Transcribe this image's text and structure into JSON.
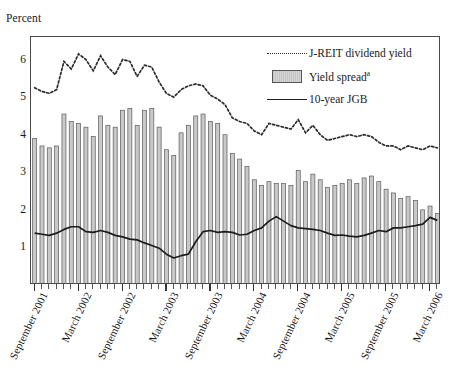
{
  "page": {
    "top_rule_text": "",
    "axis_title_y": "Percent"
  },
  "legend": {
    "items": [
      {
        "label": "J-REIT dividend yield",
        "key": "dotted-line-key",
        "color": "#2b2b2b"
      },
      {
        "label": "Yield spread",
        "sup": "a",
        "key": "gray-box-key",
        "color": "#c9c9c9"
      },
      {
        "label": "10-year JGB",
        "key": "solid-line-key",
        "color": "#1c1c1c"
      }
    ]
  },
  "chart_data": {
    "type": "bar",
    "title": "",
    "subtitle": "",
    "xlabel": "",
    "ylabel": "Percent",
    "ylim": [
      0,
      6.6
    ],
    "yticks": [
      1,
      2,
      3,
      4,
      5,
      6
    ],
    "grid": false,
    "legend_position": "top-right",
    "x": [
      "September 2001",
      "October 2001",
      "November 2001",
      "December 2001",
      "January 2002",
      "February 2002",
      "March 2002",
      "April 2002",
      "May 2002",
      "June 2002",
      "July 2002",
      "August 2002",
      "September 2002",
      "October 2002",
      "November 2002",
      "December 2002",
      "January 2003",
      "February 2003",
      "March 2003",
      "April 2003",
      "May 2003",
      "June 2003",
      "July 2003",
      "August 2003",
      "September 2003",
      "October 2003",
      "November 2003",
      "December 2003",
      "January 2004",
      "February 2004",
      "March 2004",
      "April 2004",
      "May 2004",
      "June 2004",
      "July 2004",
      "August 2004",
      "September 2004",
      "October 2004",
      "November 2004",
      "December 2004",
      "January 2005",
      "February 2005",
      "March 2005",
      "April 2005",
      "May 2005",
      "June 2005",
      "July 2005",
      "August 2005",
      "September 2005",
      "October 2005",
      "November 2005",
      "December 2005",
      "January 2006",
      "February 2006",
      "March 2006",
      "April 2006"
    ],
    "xtick_labels": [
      "September 2001",
      "March 2002",
      "September 2002",
      "March 2003",
      "September 2003",
      "March 2004",
      "September 2004",
      "March 2005",
      "September 2005",
      "March 2006"
    ],
    "xtick_indices": [
      0,
      6,
      12,
      18,
      24,
      30,
      36,
      42,
      48,
      54
    ],
    "series": [
      {
        "name": "Yield spread",
        "type": "bar",
        "color": "#c9c9c9",
        "values": [
          3.9,
          3.7,
          3.65,
          3.7,
          4.55,
          4.35,
          4.3,
          4.2,
          3.95,
          4.5,
          4.25,
          4.2,
          4.65,
          4.7,
          4.25,
          4.65,
          4.7,
          4.2,
          3.6,
          3.45,
          4.05,
          4.25,
          4.5,
          4.55,
          4.35,
          4.3,
          4.0,
          3.5,
          3.35,
          3.15,
          2.8,
          2.65,
          2.75,
          2.7,
          2.7,
          2.65,
          3.05,
          2.75,
          2.95,
          2.8,
          2.6,
          2.65,
          2.7,
          2.8,
          2.7,
          2.85,
          2.9,
          2.75,
          2.55,
          2.45,
          2.3,
          2.35,
          2.25,
          2.0,
          2.1,
          1.9
        ]
      },
      {
        "name": "J-REIT dividend yield",
        "type": "line",
        "style": "dotted",
        "color": "#2b2b2b",
        "values": [
          5.25,
          5.15,
          5.1,
          5.2,
          5.95,
          5.75,
          6.15,
          6.0,
          5.7,
          6.1,
          5.8,
          5.6,
          6.0,
          5.95,
          5.55,
          5.85,
          5.8,
          5.4,
          5.1,
          5.0,
          5.2,
          5.3,
          5.35,
          5.3,
          5.05,
          4.95,
          4.8,
          4.45,
          4.35,
          4.3,
          4.1,
          4.0,
          4.3,
          4.25,
          4.2,
          4.15,
          4.4,
          4.05,
          4.25,
          4.0,
          3.85,
          3.9,
          3.95,
          4.0,
          3.95,
          4.0,
          3.95,
          3.8,
          3.7,
          3.7,
          3.6,
          3.7,
          3.65,
          3.6,
          3.7,
          3.65
        ]
      },
      {
        "name": "10-year JGB",
        "type": "line",
        "style": "solid",
        "color": "#1c1c1c",
        "values": [
          1.38,
          1.35,
          1.32,
          1.38,
          1.48,
          1.55,
          1.55,
          1.42,
          1.4,
          1.45,
          1.4,
          1.32,
          1.28,
          1.22,
          1.2,
          1.12,
          1.05,
          0.98,
          0.82,
          0.72,
          0.78,
          0.82,
          1.15,
          1.42,
          1.45,
          1.4,
          1.42,
          1.4,
          1.33,
          1.35,
          1.45,
          1.52,
          1.7,
          1.82,
          1.7,
          1.58,
          1.52,
          1.5,
          1.48,
          1.45,
          1.38,
          1.32,
          1.33,
          1.3,
          1.28,
          1.32,
          1.38,
          1.45,
          1.42,
          1.52,
          1.52,
          1.55,
          1.58,
          1.62,
          1.8,
          1.72
        ]
      }
    ]
  }
}
